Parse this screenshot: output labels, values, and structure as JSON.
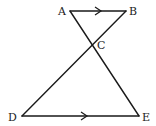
{
  "diagram": {
    "type": "geometry",
    "points": {
      "A": {
        "label": "A"
      },
      "B": {
        "label": "B"
      },
      "C": {
        "label": "C"
      },
      "D": {
        "label": "D"
      },
      "E": {
        "label": "E"
      }
    },
    "segments": [
      {
        "from": "A",
        "to": "B",
        "parallel_mark": true
      },
      {
        "from": "A",
        "to": "E",
        "parallel_mark": false
      },
      {
        "from": "B",
        "to": "D",
        "parallel_mark": false
      },
      {
        "from": "D",
        "to": "E",
        "parallel_mark": true
      }
    ],
    "relations": [
      "AB ∥ DE"
    ]
  }
}
